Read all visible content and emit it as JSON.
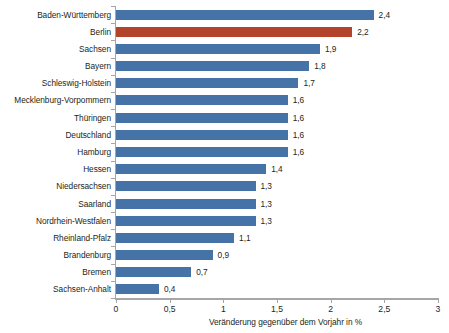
{
  "chart_data": {
    "type": "bar",
    "orientation": "horizontal",
    "title": "",
    "subtitle": "",
    "xlabel": "Veränderung gegenüber dem Vorjahr in %",
    "ylabel": "",
    "xlim": [
      0,
      3
    ],
    "xticks": [
      "0",
      "0,5",
      "1",
      "1,5",
      "2",
      "2,5",
      "3"
    ],
    "xtick_values": [
      0,
      0.5,
      1,
      1.5,
      2,
      2.5,
      3
    ],
    "grid": false,
    "legend": "none",
    "decimal_separator": ",",
    "categories": [
      "Baden-Württemberg",
      "Berlin",
      "Sachsen",
      "Bayern",
      "Schleswig-Holstein",
      "Mecklenburg-Vorpommern",
      "Thüringen",
      "Deutschland",
      "Hamburg",
      "Hessen",
      "Niedersachsen",
      "Saarland",
      "Nordrhein-Westfalen",
      "Rheinland-Pfalz",
      "Brandenburg",
      "Bremen",
      "Sachsen-Anhalt"
    ],
    "values": [
      2.4,
      2.2,
      1.9,
      1.8,
      1.7,
      1.6,
      1.6,
      1.6,
      1.6,
      1.4,
      1.3,
      1.3,
      1.3,
      1.1,
      0.9,
      0.7,
      0.4
    ],
    "value_labels": [
      "2,4",
      "2,2",
      "1,9",
      "1,8",
      "1,7",
      "1,6",
      "1,6",
      "1,6",
      "1,6",
      "1,4",
      "1,3",
      "1,3",
      "1,3",
      "1,1",
      "0,9",
      "0,7",
      "0,4"
    ],
    "highlight_index": 1,
    "colors": {
      "bar": "#4573a7",
      "bar_highlight": "#b4432b",
      "axis": "#a6a6a6",
      "text": "#231f20",
      "background": "#ffffff"
    }
  }
}
